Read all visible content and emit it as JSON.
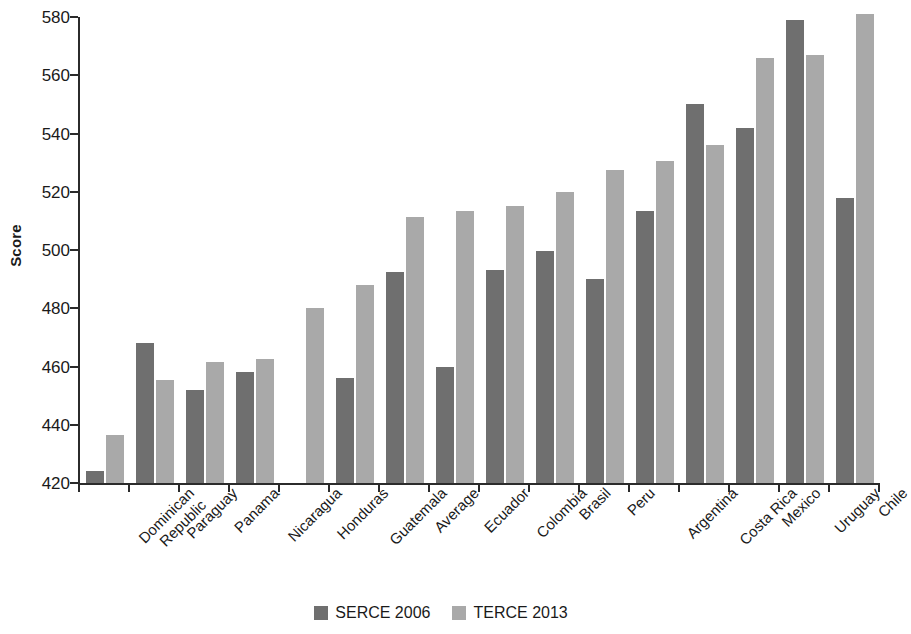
{
  "chart_data": {
    "type": "bar",
    "title": "",
    "subtitle": "",
    "xlabel": "",
    "ylabel": "Score",
    "ylim": [
      420,
      580
    ],
    "ytick_step": 20,
    "yticks": [
      420,
      440,
      460,
      480,
      500,
      520,
      540,
      560,
      580
    ],
    "grid": false,
    "legend_position": "bottom-center",
    "categories": [
      "Dominican\nRepublic",
      "Paraguay",
      "Panama",
      "Nicaragua",
      "Honduras",
      "Guatemala",
      "Average",
      "Ecuador",
      "Colombia",
      "Brasil",
      "Peru",
      "Argentina",
      "Costa Rica",
      "Mexico",
      "Uruguay",
      "Chile"
    ],
    "series": [
      {
        "name": "SERCE 2006",
        "color": "#6f6f6f",
        "values": [
          424,
          468,
          452,
          458,
          null,
          456,
          492.5,
          460,
          493,
          499.5,
          490,
          513.5,
          550,
          542,
          579,
          518
        ]
      },
      {
        "name": "TERCE 2013",
        "color": "#a9a9a9",
        "values": [
          436.5,
          455.5,
          461.5,
          462.5,
          480,
          488,
          511.5,
          513.5,
          515,
          520,
          527.5,
          530.5,
          536,
          566,
          567,
          581
        ]
      }
    ]
  },
  "legend": {
    "items": [
      {
        "label": "SERCE 2006",
        "color": "#6f6f6f",
        "swatch": "serce"
      },
      {
        "label": "TERCE 2013",
        "color": "#a9a9a9",
        "swatch": "terce"
      }
    ]
  },
  "axis": {
    "y_title": "Score"
  }
}
